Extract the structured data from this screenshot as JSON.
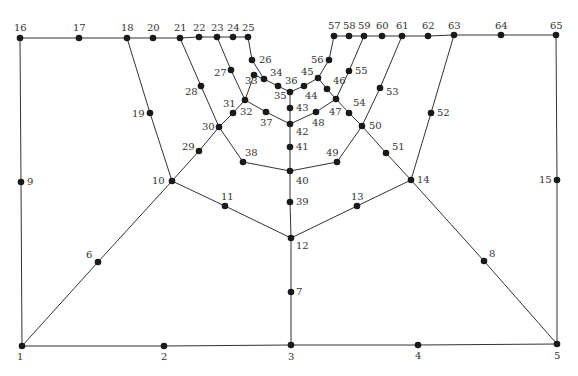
{
  "diagram": {
    "type": "planar-graph-mesh",
    "colors": {
      "edge": "#333333",
      "node": "#1a1a1a",
      "label": "#333333",
      "background": "#ffffff"
    },
    "nodes": [
      {
        "id": "1",
        "x": 22,
        "y": 346,
        "lx": 17,
        "ly": 360
      },
      {
        "id": "2",
        "x": 164,
        "y": 346,
        "lx": 161,
        "ly": 360
      },
      {
        "id": "3",
        "x": 291,
        "y": 345,
        "lx": 288,
        "ly": 360
      },
      {
        "id": "4",
        "x": 418,
        "y": 345,
        "lx": 415,
        "ly": 359
      },
      {
        "id": "5",
        "x": 557,
        "y": 344,
        "lx": 554,
        "ly": 359
      },
      {
        "id": "6",
        "x": 98,
        "y": 262,
        "lx": 86,
        "ly": 258
      },
      {
        "id": "7",
        "x": 291,
        "y": 292,
        "lx": 296,
        "ly": 295
      },
      {
        "id": "8",
        "x": 484,
        "y": 261,
        "lx": 489,
        "ly": 257
      },
      {
        "id": "9",
        "x": 21,
        "y": 182,
        "lx": 27,
        "ly": 185
      },
      {
        "id": "10",
        "x": 172,
        "y": 181,
        "lx": 152,
        "ly": 184
      },
      {
        "id": "11",
        "x": 225,
        "y": 206,
        "lx": 221,
        "ly": 200
      },
      {
        "id": "12",
        "x": 291,
        "y": 238,
        "lx": 296,
        "ly": 249
      },
      {
        "id": "13",
        "x": 357,
        "y": 206,
        "lx": 351,
        "ly": 200
      },
      {
        "id": "14",
        "x": 411,
        "y": 180,
        "lx": 417,
        "ly": 183
      },
      {
        "id": "15",
        "x": 557,
        "y": 180,
        "lx": 539,
        "ly": 183
      },
      {
        "id": "16",
        "x": 20,
        "y": 38,
        "lx": 14,
        "ly": 31
      },
      {
        "id": "17",
        "x": 79,
        "y": 38,
        "lx": 73,
        "ly": 31
      },
      {
        "id": "18",
        "x": 127,
        "y": 38,
        "lx": 121,
        "ly": 31
      },
      {
        "id": "19",
        "x": 150,
        "y": 113,
        "lx": 132,
        "ly": 117
      },
      {
        "id": "20",
        "x": 153,
        "y": 38,
        "lx": 147,
        "ly": 31
      },
      {
        "id": "21",
        "x": 180,
        "y": 38,
        "lx": 174,
        "ly": 31
      },
      {
        "id": "22",
        "x": 199,
        "y": 37,
        "lx": 193,
        "ly": 31
      },
      {
        "id": "23",
        "x": 217,
        "y": 37,
        "lx": 211,
        "ly": 31
      },
      {
        "id": "24",
        "x": 233,
        "y": 37,
        "lx": 227,
        "ly": 31
      },
      {
        "id": "25",
        "x": 248,
        "y": 37,
        "lx": 242,
        "ly": 31
      },
      {
        "id": "26",
        "x": 252,
        "y": 60,
        "lx": 259,
        "ly": 63
      },
      {
        "id": "27",
        "x": 231,
        "y": 70,
        "lx": 214,
        "ly": 76
      },
      {
        "id": "28",
        "x": 201,
        "y": 86,
        "lx": 185,
        "ly": 95
      },
      {
        "id": "29",
        "x": 199,
        "y": 151,
        "lx": 182,
        "ly": 150
      },
      {
        "id": "30",
        "x": 219,
        "y": 127,
        "lx": 202,
        "ly": 130
      },
      {
        "id": "31",
        "x": 245,
        "y": 100,
        "lx": 223,
        "ly": 107
      },
      {
        "id": "32",
        "x": 233,
        "y": 113,
        "lx": 240,
        "ly": 115
      },
      {
        "id": "33",
        "x": 254,
        "y": 75,
        "lx": 245,
        "ly": 84
      },
      {
        "id": "34",
        "x": 264,
        "y": 79,
        "lx": 270,
        "ly": 76
      },
      {
        "id": "35",
        "x": 278,
        "y": 86,
        "lx": 274,
        "ly": 99
      },
      {
        "id": "36",
        "x": 290,
        "y": 92,
        "lx": 285,
        "ly": 84
      },
      {
        "id": "37",
        "x": 266,
        "y": 112,
        "lx": 260,
        "ly": 126
      },
      {
        "id": "38",
        "x": 243,
        "y": 162,
        "lx": 245,
        "ly": 156
      },
      {
        "id": "39",
        "x": 290,
        "y": 202,
        "lx": 296,
        "ly": 205
      },
      {
        "id": "40",
        "x": 290,
        "y": 171,
        "lx": 296,
        "ly": 184
      },
      {
        "id": "41",
        "x": 290,
        "y": 147,
        "lx": 296,
        "ly": 150
      },
      {
        "id": "42",
        "x": 290,
        "y": 124,
        "lx": 296,
        "ly": 135
      },
      {
        "id": "43",
        "x": 290,
        "y": 108,
        "lx": 296,
        "ly": 111
      },
      {
        "id": "44",
        "x": 304,
        "y": 86,
        "lx": 305,
        "ly": 99
      },
      {
        "id": "45",
        "x": 318,
        "y": 78,
        "lx": 301,
        "ly": 75
      },
      {
        "id": "46",
        "x": 327,
        "y": 89,
        "lx": 333,
        "ly": 84
      },
      {
        "id": "47",
        "x": 336,
        "y": 99,
        "lx": 329,
        "ly": 115
      },
      {
        "id": "48",
        "x": 316,
        "y": 112,
        "lx": 312,
        "ly": 126
      },
      {
        "id": "49",
        "x": 337,
        "y": 162,
        "lx": 326,
        "ly": 156
      },
      {
        "id": "50",
        "x": 362,
        "y": 126,
        "lx": 369,
        "ly": 129
      },
      {
        "id": "51",
        "x": 386,
        "y": 153,
        "lx": 392,
        "ly": 150
      },
      {
        "id": "52",
        "x": 431,
        "y": 113,
        "lx": 437,
        "ly": 116
      },
      {
        "id": "53",
        "x": 380,
        "y": 88,
        "lx": 386,
        "ly": 95
      },
      {
        "id": "54",
        "x": 349,
        "y": 113,
        "lx": 353,
        "ly": 106
      },
      {
        "id": "55",
        "x": 349,
        "y": 71,
        "lx": 355,
        "ly": 74
      },
      {
        "id": "56",
        "x": 329,
        "y": 60,
        "lx": 311,
        "ly": 63
      },
      {
        "id": "57",
        "x": 334,
        "y": 36,
        "lx": 328,
        "ly": 29
      },
      {
        "id": "58",
        "x": 349,
        "y": 36,
        "lx": 343,
        "ly": 29
      },
      {
        "id": "59",
        "x": 364,
        "y": 36,
        "lx": 358,
        "ly": 29
      },
      {
        "id": "60",
        "x": 382,
        "y": 36,
        "lx": 376,
        "ly": 29
      },
      {
        "id": "61",
        "x": 402,
        "y": 36,
        "lx": 396,
        "ly": 29
      },
      {
        "id": "62",
        "x": 428,
        "y": 36,
        "lx": 422,
        "ly": 29
      },
      {
        "id": "63",
        "x": 454,
        "y": 35,
        "lx": 448,
        "ly": 29
      },
      {
        "id": "64",
        "x": 501,
        "y": 35,
        "lx": 495,
        "ly": 29
      },
      {
        "id": "65",
        "x": 556,
        "y": 35,
        "lx": 550,
        "ly": 29
      }
    ],
    "edges": [
      [
        "1",
        "2"
      ],
      [
        "2",
        "3"
      ],
      [
        "3",
        "4"
      ],
      [
        "4",
        "5"
      ],
      [
        "1",
        "9"
      ],
      [
        "9",
        "16"
      ],
      [
        "5",
        "15"
      ],
      [
        "15",
        "65"
      ],
      [
        "16",
        "17"
      ],
      [
        "17",
        "18"
      ],
      [
        "18",
        "20"
      ],
      [
        "20",
        "21"
      ],
      [
        "21",
        "22"
      ],
      [
        "22",
        "23"
      ],
      [
        "23",
        "24"
      ],
      [
        "24",
        "25"
      ],
      [
        "57",
        "58"
      ],
      [
        "58",
        "59"
      ],
      [
        "59",
        "60"
      ],
      [
        "60",
        "61"
      ],
      [
        "61",
        "62"
      ],
      [
        "62",
        "63"
      ],
      [
        "63",
        "64"
      ],
      [
        "64",
        "65"
      ],
      [
        "1",
        "6"
      ],
      [
        "6",
        "10"
      ],
      [
        "5",
        "8"
      ],
      [
        "8",
        "14"
      ],
      [
        "3",
        "7"
      ],
      [
        "7",
        "12"
      ],
      [
        "10",
        "11"
      ],
      [
        "11",
        "12"
      ],
      [
        "12",
        "13"
      ],
      [
        "13",
        "14"
      ],
      [
        "12",
        "39"
      ],
      [
        "39",
        "40"
      ],
      [
        "40",
        "41"
      ],
      [
        "41",
        "42"
      ],
      [
        "42",
        "43"
      ],
      [
        "43",
        "36"
      ],
      [
        "18",
        "19"
      ],
      [
        "19",
        "10"
      ],
      [
        "10",
        "29"
      ],
      [
        "29",
        "30"
      ],
      [
        "30",
        "32"
      ],
      [
        "32",
        "31"
      ],
      [
        "21",
        "28"
      ],
      [
        "28",
        "30"
      ],
      [
        "30",
        "38"
      ],
      [
        "38",
        "40"
      ],
      [
        "40",
        "49"
      ],
      [
        "49",
        "50"
      ],
      [
        "23",
        "27"
      ],
      [
        "27",
        "31"
      ],
      [
        "31",
        "33"
      ],
      [
        "33",
        "34"
      ],
      [
        "25",
        "26"
      ],
      [
        "26",
        "34"
      ],
      [
        "34",
        "35"
      ],
      [
        "35",
        "36"
      ],
      [
        "31",
        "37"
      ],
      [
        "37",
        "42"
      ],
      [
        "36",
        "44"
      ],
      [
        "44",
        "45"
      ],
      [
        "57",
        "56"
      ],
      [
        "56",
        "45"
      ],
      [
        "45",
        "46"
      ],
      [
        "46",
        "47"
      ],
      [
        "42",
        "48"
      ],
      [
        "48",
        "47"
      ],
      [
        "59",
        "55"
      ],
      [
        "55",
        "47"
      ],
      [
        "47",
        "54"
      ],
      [
        "54",
        "50"
      ],
      [
        "61",
        "53"
      ],
      [
        "53",
        "50"
      ],
      [
        "50",
        "51"
      ],
      [
        "51",
        "14"
      ],
      [
        "63",
        "52"
      ],
      [
        "52",
        "14"
      ]
    ]
  }
}
